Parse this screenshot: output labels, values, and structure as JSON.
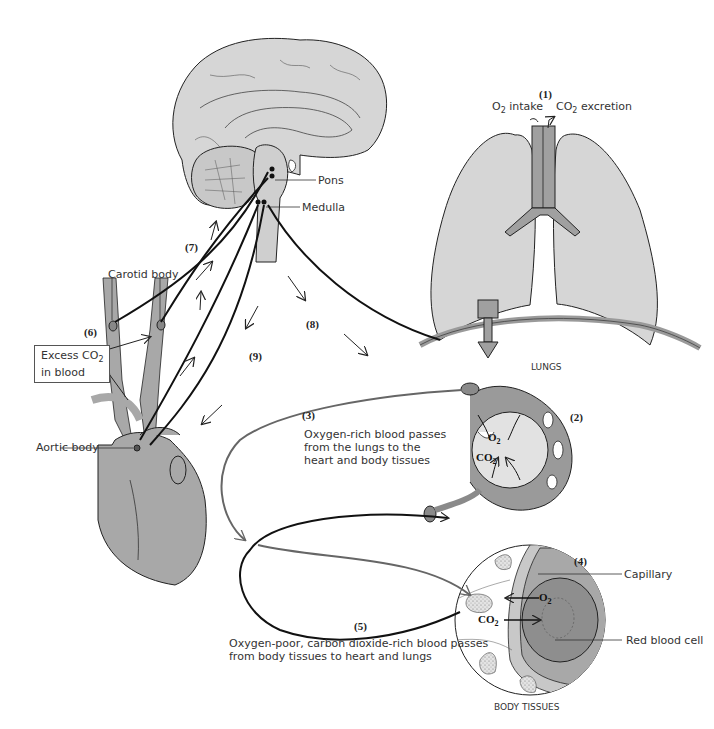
{
  "diagram": {
    "colors": {
      "tissue_fill": "#d6d6d6",
      "vessel_fill": "#a8a8a8",
      "dark_fill": "#8e8e8e",
      "stroke": "#222222",
      "oxygen_rich_path": "#6a6a6a",
      "oxygen_poor_path": "#111111"
    },
    "brain": {
      "labels": {
        "pons": "Pons",
        "medulla": "Medulla"
      }
    },
    "lungs": {
      "step": "(1)",
      "o2_intake": "O",
      "o2_sub": "2",
      "o2_intake_suffix": " intake",
      "co2_excretion_prefix": "CO",
      "co2_sub": "2",
      "co2_excretion_suffix": " excretion",
      "label": "LUNGS"
    },
    "alveolus": {
      "step": "(2)",
      "o2": "O",
      "o2_sub": "2",
      "co2": "CO",
      "co2_sub": "2"
    },
    "step3": {
      "number": "(3)",
      "caption_lines": [
        "Oxygen-rich blood passes",
        "from the lungs to the",
        "heart and body tissues"
      ]
    },
    "body_tissues": {
      "step": "(4)",
      "o2": "O",
      "o2_sub": "2",
      "co2": "CO",
      "co2_sub": "2",
      "capillary": "Capillary",
      "red_blood_cell": "Red blood cell",
      "label": "BODY TISSUES"
    },
    "step5": {
      "number": "(5)",
      "caption_lines": [
        "Oxygen-poor, carbon dioxide-rich blood passes",
        "from body tissues to heart and lungs"
      ]
    },
    "step6": {
      "number": "(6)",
      "carotid_body": "Carotid body",
      "excess_line1_prefix": "Excess CO",
      "excess_sub": "2",
      "excess_line2": "in blood"
    },
    "heart": {
      "aortic_body": "Aortic body"
    },
    "step7": {
      "number": "(7)"
    },
    "step8": {
      "number": "(8)"
    },
    "step9": {
      "number": "(9)"
    }
  }
}
